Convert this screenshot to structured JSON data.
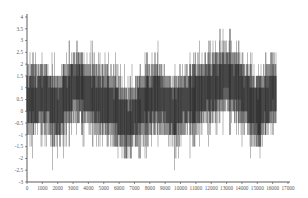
{
  "chart_data": {
    "type": "line",
    "title": "",
    "xlabel": "",
    "ylabel": "",
    "xlim": [
      0,
      17000
    ],
    "ylim": [
      -3,
      4
    ],
    "grid": false,
    "legend": null,
    "x_ticks": [
      0,
      1000,
      2000,
      3000,
      4000,
      5000,
      6000,
      7000,
      8000,
      9000,
      10000,
      11000,
      12000,
      13000,
      14000,
      15000,
      16000,
      17000
    ],
    "x_tick_labels": [
      "0",
      "1000",
      "2000",
      "3000",
      "4000",
      "5000",
      "6000",
      "7000",
      "8000",
      "9000",
      "10000",
      "11000",
      "12000",
      "13000",
      "14000",
      "15000",
      "16000",
      "17000"
    ],
    "y_ticks": [
      -3,
      -2.5,
      -2,
      -1.5,
      -1,
      -0.5,
      0,
      0.5,
      1,
      1.5,
      2,
      2.5,
      3,
      3.5,
      4
    ],
    "y_tick_labels": [
      "-3",
      "-2.5",
      "-2",
      "-1.5",
      "-1",
      "-0.5",
      "0",
      "0.5",
      "1",
      "1.5",
      "2",
      "2.5",
      "3",
      "3.5",
      "4"
    ],
    "series": [
      {
        "name": "signal",
        "color": "#2a2a2a",
        "n_points": 16200,
        "description": "Dense high-frequency oscillating signal with slowly varying mean (quantized in 0.5 steps)",
        "envelope_samples": {
          "x": [
            0,
            1000,
            2000,
            3000,
            3500,
            4500,
            5500,
            6500,
            7500,
            8500,
            9500,
            10500,
            11500,
            12500,
            13000,
            14000,
            15000,
            16000
          ],
          "center": [
            0.5,
            0.7,
            0.0,
            1.0,
            1.0,
            0.5,
            0.3,
            -0.5,
            0.2,
            0.7,
            0.0,
            0.5,
            0.8,
            1.2,
            1.5,
            0.8,
            0.0,
            0.8
          ],
          "min": [
            -2.0,
            -2.0,
            -2.5,
            -1.5,
            -1.5,
            -2.0,
            -1.5,
            -2.5,
            -2.0,
            -1.5,
            -2.5,
            -2.0,
            -1.5,
            -1.0,
            -1.0,
            -1.5,
            -2.0,
            -1.0
          ],
          "max": [
            3.0,
            2.5,
            2.5,
            3.5,
            3.0,
            3.0,
            2.5,
            2.0,
            2.5,
            3.0,
            2.0,
            2.5,
            3.0,
            3.5,
            4.0,
            3.0,
            2.0,
            3.0
          ]
        }
      }
    ]
  },
  "render": {
    "plot_left_px": 27,
    "plot_right_px": 288,
    "plot_top_px": 17,
    "plot_bottom_px": 182,
    "data_x_end": 16200
  }
}
